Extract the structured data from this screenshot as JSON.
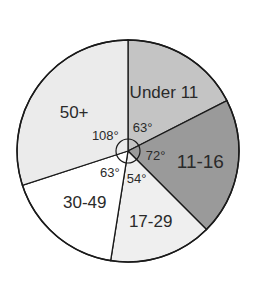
{
  "chart_data": {
    "type": "pie",
    "title": "",
    "unit": "degrees",
    "start_angle": "top (12 o'clock), clockwise",
    "categories": [
      "Under 11",
      "11-16",
      "17-29",
      "30-49",
      "50+"
    ],
    "values": [
      63,
      72,
      54,
      63,
      108
    ],
    "angle_labels": [
      "63°",
      "72°",
      "54°",
      "63°",
      "108°"
    ],
    "colors": [
      "#c4c4c4",
      "#9a9a9a",
      "#efefef",
      "#ffffff",
      "#ebebeb"
    ],
    "center_circle": true,
    "legend": "none (labels inside slices)"
  }
}
